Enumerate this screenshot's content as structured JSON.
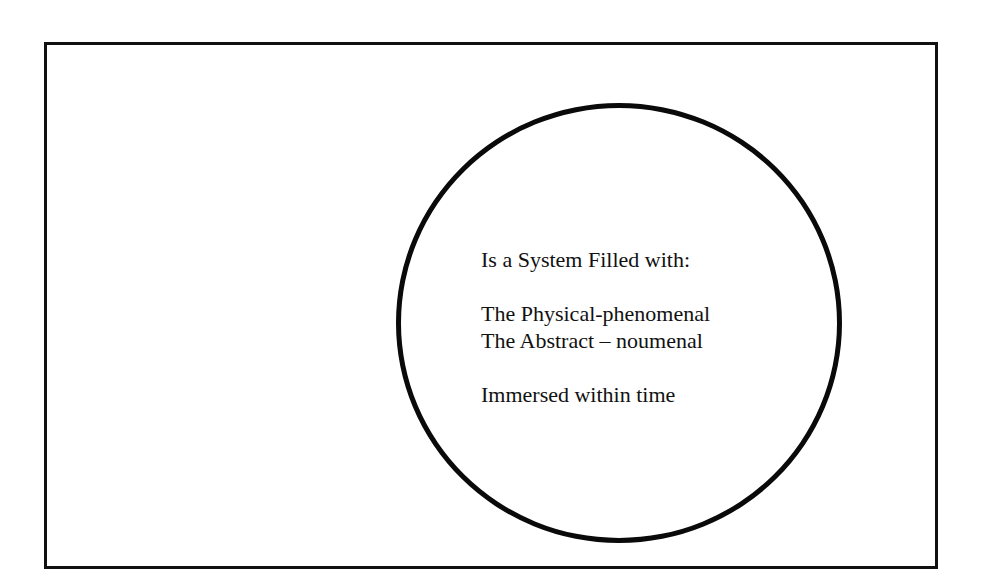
{
  "diagram": {
    "frame": {
      "stroke_color": "#111111"
    },
    "circle": {
      "stroke_color": "#0a0a0a"
    },
    "text": {
      "heading": "Is a System Filled with:",
      "items": [
        "The Physical-phenomenal",
        "The Abstract – noumenal"
      ],
      "footer": "Immersed within time"
    }
  }
}
